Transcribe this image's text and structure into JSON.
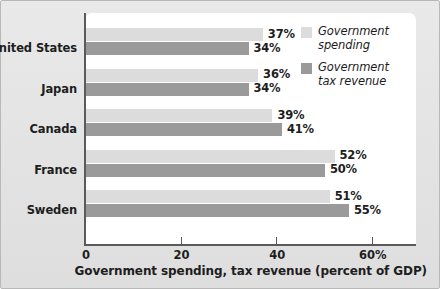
{
  "chart_data": {
    "type": "bar",
    "orientation": "horizontal",
    "title": "",
    "xlabel": "Government spending, tax revenue (percent of GDP)",
    "ylabel": "",
    "categories": [
      "United States",
      "Japan",
      "Canada",
      "France",
      "Sweden"
    ],
    "series": [
      {
        "name": "Government spending",
        "color": "#dcdcdc",
        "values": [
          37,
          36,
          39,
          52,
          51
        ],
        "labels": [
          "37%",
          "34%",
          "39%",
          "52%",
          "51%"
        ]
      },
      {
        "name": "Government tax revenue",
        "color": "#9a9a9a",
        "values": [
          34,
          34,
          41,
          50,
          55
        ],
        "labels": [
          "34%",
          "34%",
          "41%",
          "50%",
          "55%"
        ]
      }
    ],
    "xlim": [
      0,
      63
    ],
    "xticks": [
      0,
      20,
      40,
      60
    ],
    "xtick_labels": [
      "0",
      "20",
      "40",
      "60%"
    ],
    "grid": false,
    "legend_position": "top-right"
  },
  "rows": [
    {
      "category": "United States",
      "spending_value": 37,
      "spending_label": "37%",
      "revenue_value": 34,
      "revenue_label": "34%"
    },
    {
      "category": "Japan",
      "spending_value": 36,
      "spending_label": "36%",
      "revenue_value": 34,
      "revenue_label": "34%"
    },
    {
      "category": "Canada",
      "spending_value": 39,
      "spending_label": "39%",
      "revenue_value": 41,
      "revenue_label": "41%"
    },
    {
      "category": "France",
      "spending_value": 52,
      "spending_label": "52%",
      "revenue_value": 50,
      "revenue_label": "50%"
    },
    {
      "category": "Sweden",
      "spending_value": 51,
      "spending_label": "51%",
      "revenue_value": 55,
      "revenue_label": "55%"
    }
  ],
  "axis": {
    "ticks": [
      {
        "value": 0,
        "label": "0"
      },
      {
        "value": 20,
        "label": "20"
      },
      {
        "value": 40,
        "label": "40"
      },
      {
        "value": 60,
        "label": "60%"
      }
    ],
    "title": "Government spending, tax revenue (percent of GDP)"
  },
  "legend": {
    "items": [
      {
        "label_line1": "Government",
        "label_line2": "spending",
        "color": "#dcdcdc"
      },
      {
        "label_line1": "Government",
        "label_line2": "tax revenue",
        "color": "#9a9a9a"
      }
    ]
  },
  "colors": {
    "spending": "#dcdcdc",
    "revenue": "#9a9a9a",
    "axis": "#5a5a5a",
    "panel": "#ffffff",
    "background": "#e5e5e5",
    "text": "#1d1d1d"
  }
}
